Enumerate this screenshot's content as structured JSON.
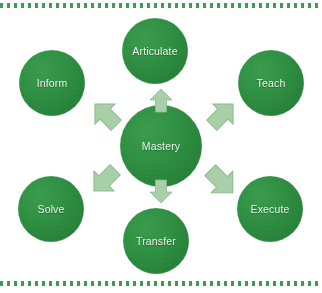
{
  "diagram": {
    "title": "Mastery",
    "center": {
      "id": "mastery",
      "label": "Mastery"
    },
    "nodes": [
      {
        "id": "articulate",
        "label": "Articulate",
        "position": "top"
      },
      {
        "id": "teach",
        "label": "Teach",
        "position": "top-right"
      },
      {
        "id": "execute",
        "label": "Execute",
        "position": "bottom-right"
      },
      {
        "id": "transfer",
        "label": "Transfer",
        "position": "bottom"
      },
      {
        "id": "solve",
        "label": "Solve",
        "position": "bottom-left"
      },
      {
        "id": "inform",
        "label": "Inform",
        "position": "top-left"
      }
    ],
    "arrows": [
      {
        "id": "arrow-to-articulate",
        "from": "mastery",
        "to": "articulate",
        "direction": "up"
      },
      {
        "id": "arrow-to-teach",
        "from": "mastery",
        "to": "teach",
        "direction": "up-right"
      },
      {
        "id": "arrow-to-execute",
        "from": "mastery",
        "to": "execute",
        "direction": "down-right"
      },
      {
        "id": "arrow-to-transfer",
        "from": "mastery",
        "to": "transfer",
        "direction": "down"
      },
      {
        "id": "arrow-to-solve",
        "from": "mastery",
        "to": "solve",
        "direction": "down-left"
      },
      {
        "id": "arrow-to-inform",
        "from": "mastery",
        "to": "inform",
        "direction": "up-left"
      }
    ],
    "colors": {
      "node_green": "#2f8f42",
      "node_green_light": "#3c9c4e",
      "node_green_dark": "#1f7333",
      "arrow_green": "#a8cfa8",
      "arrow_green_edge": "#8bbd8b",
      "label_text": "#eaf3ea",
      "border_dots": "#2f8f42",
      "background": "#ffffff"
    }
  }
}
